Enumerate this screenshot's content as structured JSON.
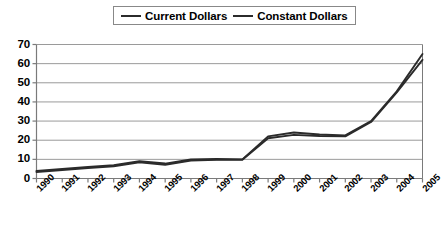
{
  "chart_data": {
    "type": "line",
    "title": "",
    "xlabel": "",
    "ylabel": "",
    "ylim": [
      0,
      70
    ],
    "ytick_step": 10,
    "yticks": [
      "0",
      "10",
      "20",
      "30",
      "40",
      "50",
      "60",
      "70"
    ],
    "grid": true,
    "legend_position": "top-center",
    "categories": [
      "1990",
      "1991",
      "1992",
      "1993",
      "1994",
      "1995",
      "1996",
      "1997",
      "1998",
      "1999",
      "2000",
      "2001",
      "2002",
      "2003",
      "2004",
      "2005"
    ],
    "series": [
      {
        "name": "Current Dollars",
        "color": "#2b2b2b",
        "values": [
          4.0,
          5.0,
          6.0,
          7.0,
          9.0,
          7.8,
          10.0,
          10.2,
          10.0,
          22.0,
          24.0,
          23.0,
          22.5,
          30.0,
          45.5,
          65.0
        ]
      },
      {
        "name": "Constant Dollars",
        "color": "#2b2b2b",
        "values": [
          3.4,
          4.4,
          5.4,
          6.4,
          8.4,
          7.2,
          9.4,
          9.8,
          9.8,
          21.0,
          22.8,
          22.2,
          22.0,
          29.5,
          45.0,
          62.0
        ]
      }
    ]
  },
  "legend": {
    "entries": [
      {
        "label": "Current Dollars",
        "marker": "line-swatch"
      },
      {
        "label": "Constant Dollars",
        "marker": "line-swatch"
      }
    ]
  },
  "colors": {
    "series_line": "#2b2b2b",
    "gridline": "#9a9a9a",
    "axis": "#7a7a7a",
    "plot_background": "#ffffff",
    "text": "#000000"
  }
}
